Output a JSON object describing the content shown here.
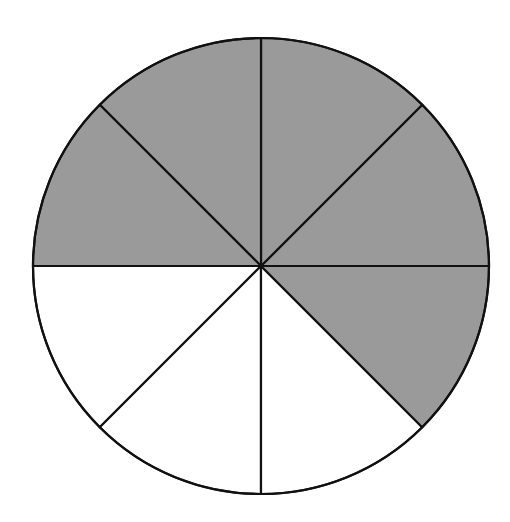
{
  "chart_data": {
    "type": "pie",
    "title": "",
    "total_sectors": 8,
    "shaded_sectors": 5,
    "unshaded_sectors": 3,
    "fraction_shaded": "5/8",
    "categories": [
      "sector-1",
      "sector-2",
      "sector-3",
      "sector-4",
      "sector-5",
      "sector-6",
      "sector-7",
      "sector-8"
    ],
    "values": [
      1,
      1,
      1,
      1,
      1,
      1,
      1,
      1
    ],
    "shaded": [
      true,
      true,
      true,
      true,
      true,
      false,
      false,
      false
    ],
    "sector_order_note": "clockwise starting from 3 o'clock going upward: right-upper, top-right, top-left, left-upper, then right-lower shaded; bottom-right, bottom-left, left-lower unshaded",
    "sectors": [
      {
        "start_deg": 0,
        "end_deg": 45,
        "shaded": true
      },
      {
        "start_deg": 45,
        "end_deg": 90,
        "shaded": true
      },
      {
        "start_deg": 90,
        "end_deg": 135,
        "shaded": true
      },
      {
        "start_deg": 135,
        "end_deg": 180,
        "shaded": true
      },
      {
        "start_deg": 180,
        "end_deg": 225,
        "shaded": false
      },
      {
        "start_deg": 225,
        "end_deg": 270,
        "shaded": false
      },
      {
        "start_deg": 270,
        "end_deg": 315,
        "shaded": false
      },
      {
        "start_deg": 315,
        "end_deg": 360,
        "shaded": true
      }
    ],
    "legend": null,
    "colors": {
      "shaded": "#9a9a9a",
      "unshaded": "#ffffff",
      "stroke": "#111111"
    }
  }
}
